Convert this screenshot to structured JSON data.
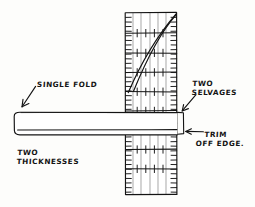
{
  "diagram": {
    "background_color": "#fdfdfb",
    "ink_color": "#141414",
    "grid_line_color": "#c9c9c9"
  },
  "labels": {
    "single_fold": "SINGLE FOLD",
    "two_thicknesses_line1": "TWO",
    "two_thicknesses_line2": "THICKNESSES",
    "two_selvages_line1": "TWO",
    "two_selvages_line2": "SELVAGES",
    "trim_off_edge_line1": "TRIM",
    "trim_off_edge_line2": "OFF EDGE."
  },
  "ruler": {
    "left": 125,
    "right": 177,
    "top": 12,
    "bottom": 195,
    "vertical_grid_lines": [
      133,
      141,
      150,
      158,
      166
    ],
    "horizontal_rules": [
      33,
      53,
      72,
      91,
      110,
      130,
      149,
      168
    ],
    "edge_tick_spacing": 4.6,
    "diagonal_lines": 2
  },
  "fabric": {
    "left": 14,
    "right": 177,
    "top": 112,
    "bottom": 135,
    "fold_line_y": 130,
    "corner_radius": 5
  },
  "annotations": {
    "single_fold_arrow": "arrow pointing down-left to fabric top-left fold",
    "two_selvages_arrow": "arrow pointing down-left to ruler right edge",
    "trim_off_edge_arrow": "arrow pointing left to trim bracket",
    "trim_bracket": "bracket on right edge of ruler from y=112 to y=134"
  }
}
